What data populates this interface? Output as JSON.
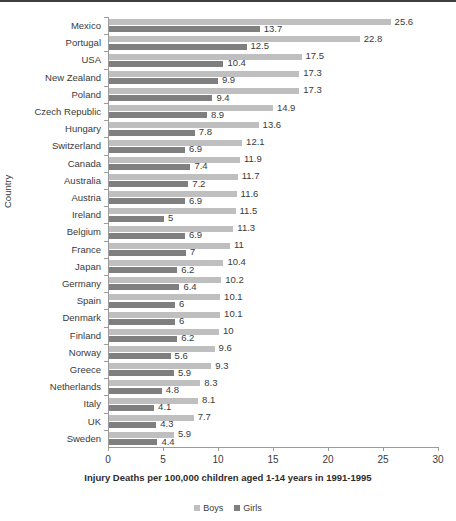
{
  "chart_data": {
    "type": "bar",
    "orientation": "horizontal",
    "title": "",
    "xlabel": "Injury Deaths per 100,000 children aged 1-14 years in 1991-1995",
    "ylabel": "Country",
    "xlim": [
      0,
      30
    ],
    "xticks": [
      0,
      5,
      10,
      15,
      20,
      25,
      30
    ],
    "grid": false,
    "legend_position": "bottom",
    "categories": [
      "Mexico",
      "Portugal",
      "USA",
      "New Zealand",
      "Poland",
      "Czech Republic",
      "Hungary",
      "Switzerland",
      "Canada",
      "Australia",
      "Austria",
      "Ireland",
      "Belgium",
      "France",
      "Japan",
      "Germany",
      "Spain",
      "Denmark",
      "Finland",
      "Norway",
      "Greece",
      "Netherlands",
      "Italy",
      "UK",
      "Sweden"
    ],
    "series": [
      {
        "name": "Boys",
        "color": "#bfbfbf",
        "values": [
          25.6,
          22.8,
          17.5,
          17.3,
          17.3,
          14.9,
          13.6,
          12.1,
          11.9,
          11.7,
          11.6,
          11.5,
          11.3,
          11,
          10.4,
          10.2,
          10.1,
          10.1,
          10,
          9.6,
          9.3,
          8.3,
          8.1,
          7.7,
          5.9
        ],
        "labels": [
          "25.6",
          "22.8",
          "17.5",
          "17.3",
          "17.3",
          "14.9",
          "13.6",
          "12.1",
          "11.9",
          "11.7",
          "11.6",
          "11.5",
          "11.3",
          "11",
          "10.4",
          "10.2",
          "10.1",
          "10.1",
          "10",
          "9.6",
          "9.3",
          "8.3",
          "8.1",
          "7.7",
          "5.9"
        ]
      },
      {
        "name": "Girls",
        "color": "#7f7f7f",
        "values": [
          13.7,
          12.5,
          10.4,
          9.9,
          9.4,
          8.9,
          7.8,
          6.9,
          7.4,
          7.2,
          6.9,
          5,
          6.9,
          7,
          6.2,
          6.4,
          6,
          6,
          6.2,
          5.6,
          5.9,
          4.8,
          4.1,
          4.3,
          4.4
        ],
        "labels": [
          "13.7",
          "12.5",
          "10.4",
          "9.9",
          "9.4",
          "8.9",
          "7.8",
          "6.9",
          "7.4",
          "7.2",
          "6.9",
          "5",
          "6.9",
          "7",
          "6.2",
          "6.4",
          "6",
          "6",
          "6.2",
          "5.6",
          "5.9",
          "4.8",
          "4.1",
          "4.3",
          "4.4"
        ]
      }
    ]
  }
}
